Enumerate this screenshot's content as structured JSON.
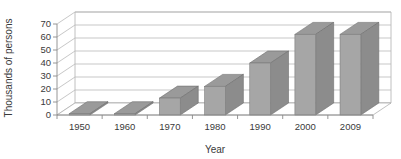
{
  "chart_data": {
    "type": "bar",
    "title": "",
    "subtitle": "",
    "xlabel": "Year",
    "ylabel": "Thousands of persons",
    "categories": [
      "1950",
      "1960",
      "1970",
      "1980",
      "1990",
      "2000",
      "2009"
    ],
    "values": [
      1,
      1,
      13,
      22,
      40,
      62,
      62
    ],
    "series": [
      {
        "name": "Thousands of persons",
        "values": [
          1,
          1,
          13,
          22,
          40,
          62,
          62
        ]
      }
    ],
    "ylim": [
      0,
      70
    ],
    "ytick_step": 10,
    "yticks": [
      "0",
      "10",
      "20",
      "30",
      "40",
      "50",
      "60",
      "70"
    ],
    "grid": true,
    "legend": false,
    "legend_position": "none",
    "style": "3d",
    "colors": {
      "bar_front": "#a6a6a6",
      "bar_side": "#8c8c8c",
      "bar_top": "#9a9a9a",
      "gridline": "#b9b9b9",
      "axis": "#8a8a8a",
      "text": "#3a3a3a",
      "background": "#ffffff"
    }
  }
}
